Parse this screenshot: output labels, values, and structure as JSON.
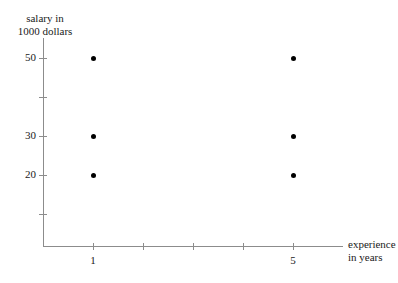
{
  "chart_data": {
    "type": "scatter",
    "title": "",
    "xlabel": "experience in years",
    "ylabel": "salary in 1000 dollars",
    "xlabel_lines": [
      "experience",
      "in years"
    ],
    "ylabel_lines": [
      "salary in",
      "1000 dollars"
    ],
    "xlim": [
      0,
      6
    ],
    "ylim": [
      0,
      60
    ],
    "grid": false,
    "legend": "none",
    "point_color": "#000000",
    "axis_color": "#8c8c8c",
    "background_color": "#ffffff",
    "x_ticks": [
      {
        "value": 1,
        "label": "1"
      },
      {
        "value": 2,
        "label": ""
      },
      {
        "value": 3,
        "label": ""
      },
      {
        "value": 4,
        "label": ""
      },
      {
        "value": 5,
        "label": "5"
      }
    ],
    "y_ticks": [
      {
        "value": 50,
        "label": "50"
      },
      {
        "value": 40,
        "label": ""
      },
      {
        "value": 30,
        "label": "30"
      },
      {
        "value": 20,
        "label": "20"
      },
      {
        "value": 10,
        "label": ""
      }
    ],
    "points": [
      {
        "x": 1,
        "y": 50
      },
      {
        "x": 1,
        "y": 30
      },
      {
        "x": 1,
        "y": 20
      },
      {
        "x": 5,
        "y": 50
      },
      {
        "x": 5,
        "y": 30
      },
      {
        "x": 5,
        "y": 20
      }
    ]
  }
}
